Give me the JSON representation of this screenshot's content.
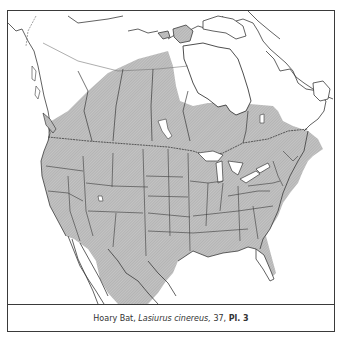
{
  "map": {
    "title": "Range map",
    "species_common": "Hoary Bat",
    "range_fill_color": "#b8b8b8",
    "line_color": "#3a3a3a",
    "water_color": "#ffffff"
  },
  "caption": {
    "common_name": "Hoary Bat,",
    "scientific_name": "Lasiurus cinereus,",
    "page": "37,",
    "plate": "Pl. 3"
  }
}
